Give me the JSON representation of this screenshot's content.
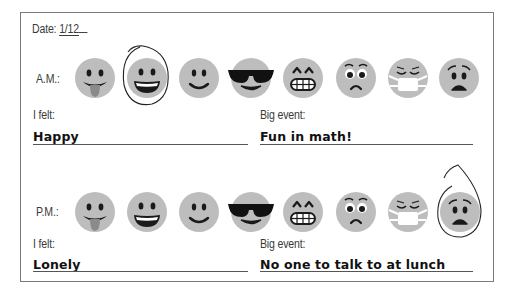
{
  "worksheet": {
    "date_label": "Date:",
    "date_value": "1/12",
    "am": {
      "period_label": "A.M.:",
      "felt_label": "I felt:",
      "felt_value": "Happy",
      "event_label": "Big event:",
      "event_value": "Fun in math!",
      "circled_index": 1
    },
    "pm": {
      "period_label": "P.M.:",
      "felt_label": "I felt:",
      "felt_value": "Lonely",
      "event_label": "Big event:",
      "event_value": "No one to talk to at lunch",
      "circled_index": 7
    },
    "emoji_options": [
      {
        "icon": "tongue-out-face-icon"
      },
      {
        "icon": "grinning-face-icon"
      },
      {
        "icon": "smiling-face-icon"
      },
      {
        "icon": "sunglasses-face-icon"
      },
      {
        "icon": "grimacing-face-icon"
      },
      {
        "icon": "frowning-wide-eyes-face-icon"
      },
      {
        "icon": "face-with-mask-icon"
      },
      {
        "icon": "worried-sad-face-icon"
      }
    ],
    "colors": {
      "face": "#bdbdbd",
      "feature": "#1a1a1a",
      "tongue": "#8a8a8a",
      "border": "#7a7a7a"
    }
  }
}
